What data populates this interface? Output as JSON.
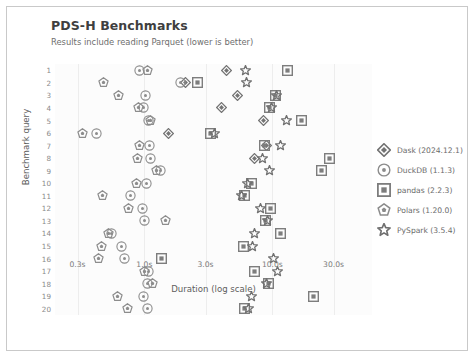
{
  "header": {
    "title": "PDS-H Benchmarks",
    "subtitle": "Results include reading Parquet (lower is better)"
  },
  "legend": {
    "position": "right",
    "items": [
      {
        "label": "Dask (2024.12.1)",
        "marker": "diamond-marker-icon",
        "color": "#737373"
      },
      {
        "label": "DuckDB (1.1.3)",
        "marker": "circle-marker-icon",
        "color": "#8c8c8c"
      },
      {
        "label": "pandas (2.2.3)",
        "marker": "square-marker-icon",
        "color": "#7d7d7d"
      },
      {
        "label": "Polars (1.20.0)",
        "marker": "pentagon-marker-icon",
        "color": "#8c8c8c"
      },
      {
        "label": "PySpark (3.5.4)",
        "marker": "star-marker-icon",
        "color": "#707070"
      }
    ]
  },
  "chart_data": {
    "type": "scatter",
    "title": "PDS-H Benchmarks",
    "subtitle": "Results include reading Parquet (lower is better)",
    "xlabel": "Duration (log scale)",
    "ylabel": "Benchmark query",
    "xscale": "log",
    "xlim": [
      0.2,
      60.0
    ],
    "ylim": [
      0.5,
      20.5
    ],
    "grid": "vertical",
    "xticks": [
      0.3,
      1.0,
      3.0,
      10.0,
      30.0
    ],
    "xticklabels": [
      "0.3s",
      "1.0s",
      "3.0s",
      "10.0s",
      "30.0s"
    ],
    "yticks": [
      1,
      2,
      3,
      4,
      5,
      6,
      7,
      8,
      9,
      10,
      11,
      12,
      13,
      14,
      15,
      16,
      17,
      18,
      19,
      20
    ],
    "yticklabels": [
      "1",
      "2",
      "3",
      "4",
      "5",
      "6",
      "7",
      "8",
      "9",
      "10",
      "11",
      "12",
      "13",
      "14",
      "15",
      "16",
      "17",
      "18",
      "19",
      "20"
    ],
    "categories": [
      1,
      2,
      3,
      4,
      5,
      6,
      7,
      8,
      9,
      10,
      11,
      12,
      13,
      14,
      15,
      16,
      17,
      18,
      19,
      20
    ],
    "series": [
      {
        "name": "Dask (2024.12.1)",
        "marker": "diamond",
        "color": "#737373",
        "points": [
          {
            "query": 1,
            "duration": 4.4
          },
          {
            "query": 2,
            "duration": 2.1
          },
          {
            "query": 3,
            "duration": 5.3
          },
          {
            "query": 4,
            "duration": 4.0
          },
          {
            "query": 5,
            "duration": 8.5
          },
          {
            "query": 6,
            "duration": 1.55
          },
          {
            "query": 7,
            "duration": 9.0
          },
          {
            "query": 8,
            "duration": 7.2
          }
        ]
      },
      {
        "name": "DuckDB (1.1.3)",
        "marker": "circle",
        "color": "#8c8c8c",
        "points": [
          {
            "query": 1,
            "duration": 0.92
          },
          {
            "query": 2,
            "duration": 1.9
          },
          {
            "query": 3,
            "duration": 1.02
          },
          {
            "query": 4,
            "duration": 0.99
          },
          {
            "query": 5,
            "duration": 1.07
          },
          {
            "query": 6,
            "duration": 0.42
          },
          {
            "query": 7,
            "duration": 1.1
          },
          {
            "query": 8,
            "duration": 1.12
          },
          {
            "query": 9,
            "duration": 1.33
          },
          {
            "query": 10,
            "duration": 1.03
          },
          {
            "query": 11,
            "duration": 0.78
          },
          {
            "query": 12,
            "duration": 0.97
          },
          {
            "query": 13,
            "duration": 1.0
          },
          {
            "query": 14,
            "duration": 0.55
          },
          {
            "query": 15,
            "duration": 0.66
          },
          {
            "query": 16,
            "duration": 0.7
          },
          {
            "query": 17,
            "duration": 1.08
          },
          {
            "query": 18,
            "duration": 1.05
          },
          {
            "query": 19,
            "duration": 0.99
          },
          {
            "query": 20,
            "duration": 1.06
          }
        ]
      },
      {
        "name": "pandas (2.2.3)",
        "marker": "square",
        "color": "#7d7d7d",
        "points": [
          {
            "query": 1,
            "duration": 13.0
          },
          {
            "query": 2,
            "duration": 2.6
          },
          {
            "query": 3,
            "duration": 10.5
          },
          {
            "query": 4,
            "duration": 9.4
          },
          {
            "query": 5,
            "duration": 17.0
          },
          {
            "query": 6,
            "duration": 3.3
          },
          {
            "query": 7,
            "duration": 8.6
          },
          {
            "query": 8,
            "duration": 28.0
          },
          {
            "query": 9,
            "duration": 24.0
          },
          {
            "query": 10,
            "duration": 6.8
          },
          {
            "query": 11,
            "duration": 6.0
          },
          {
            "query": 12,
            "duration": 9.6
          },
          {
            "query": 13,
            "duration": 8.9
          },
          {
            "query": 14,
            "duration": 11.5
          },
          {
            "query": 15,
            "duration": 5.9
          },
          {
            "query": 16,
            "duration": 1.35
          },
          {
            "query": 17,
            "duration": 7.2
          },
          {
            "query": 18,
            "duration": 9.3
          },
          {
            "query": 19,
            "duration": 21.0
          },
          {
            "query": 20,
            "duration": 6.1
          }
        ]
      },
      {
        "name": "Polars (1.20.0)",
        "marker": "pentagon",
        "color": "#8c8c8c",
        "points": [
          {
            "query": 1,
            "duration": 1.05
          },
          {
            "query": 2,
            "duration": 0.48
          },
          {
            "query": 3,
            "duration": 0.63
          },
          {
            "query": 4,
            "duration": 0.9
          },
          {
            "query": 5,
            "duration": 1.12
          },
          {
            "query": 6,
            "duration": 0.33
          },
          {
            "query": 7,
            "duration": 0.92
          },
          {
            "query": 8,
            "duration": 0.88
          },
          {
            "query": 9,
            "duration": 1.25
          },
          {
            "query": 10,
            "duration": 0.86
          },
          {
            "query": 11,
            "duration": 0.47
          },
          {
            "query": 12,
            "duration": 0.75
          },
          {
            "query": 13,
            "duration": 1.45
          },
          {
            "query": 14,
            "duration": 0.52
          },
          {
            "query": 15,
            "duration": 0.46
          },
          {
            "query": 16,
            "duration": 0.44
          },
          {
            "query": 17,
            "duration": 1.0
          },
          {
            "query": 18,
            "duration": 1.15
          },
          {
            "query": 19,
            "duration": 0.62
          },
          {
            "query": 20,
            "duration": 0.74
          }
        ]
      },
      {
        "name": "PySpark (3.5.4)",
        "marker": "star",
        "color": "#707070",
        "points": [
          {
            "query": 1,
            "duration": 6.2
          },
          {
            "query": 2,
            "duration": 6.3
          },
          {
            "query": 3,
            "duration": 10.8
          },
          {
            "query": 4,
            "duration": 9.9
          },
          {
            "query": 5,
            "duration": 12.8
          },
          {
            "query": 6,
            "duration": 3.5
          },
          {
            "query": 7,
            "duration": 11.5
          },
          {
            "query": 8,
            "duration": 8.4
          },
          {
            "query": 9,
            "duration": 9.5
          },
          {
            "query": 10,
            "duration": 6.4
          },
          {
            "query": 11,
            "duration": 5.7
          },
          {
            "query": 12,
            "duration": 8.1
          },
          {
            "query": 13,
            "duration": 9.2
          },
          {
            "query": 14,
            "duration": 7.2
          },
          {
            "query": 15,
            "duration": 7.0
          },
          {
            "query": 16,
            "duration": 10.2
          },
          {
            "query": 17,
            "duration": 11.0
          },
          {
            "query": 18,
            "duration": 9.0
          },
          {
            "query": 19,
            "duration": 6.9
          },
          {
            "query": 20,
            "duration": 6.5
          }
        ]
      }
    ]
  }
}
